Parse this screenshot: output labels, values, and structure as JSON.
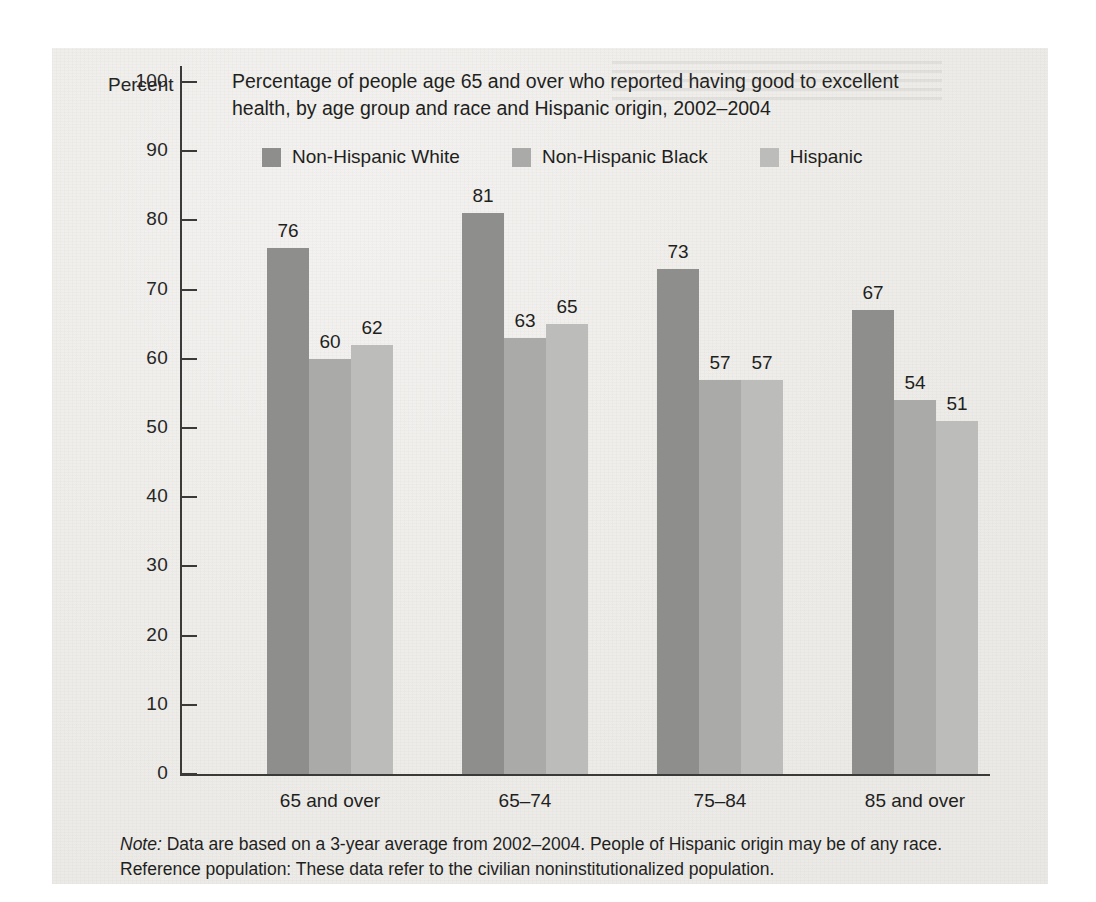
{
  "chart_data": {
    "type": "bar",
    "title": "Percentage of people age 65 and over who reported having good to excellent health, by age group and race and Hispanic origin, 2002–2004",
    "title_line1": "Percentage of people age 65 and over who reported having good to excellent",
    "title_line2": "health, by age group and race and Hispanic origin, 2002–2004",
    "xlabel": "",
    "ylabel": "Percent",
    "ylim": [
      0,
      100
    ],
    "ytick_labels": [
      "0",
      "10",
      "20",
      "30",
      "40",
      "50",
      "60",
      "70",
      "80",
      "90",
      "100"
    ],
    "ytick_values": [
      0,
      10,
      20,
      30,
      40,
      50,
      60,
      70,
      80,
      90,
      100
    ],
    "grid": false,
    "legend_position": "top",
    "categories": [
      "65 and over",
      "65–74",
      "75–84",
      "85 and over"
    ],
    "series": [
      {
        "name": "Non-Hispanic White",
        "color": "#8e8e8c",
        "values": [
          76,
          81,
          73,
          67
        ]
      },
      {
        "name": "Non-Hispanic Black",
        "color": "#aaaaa8",
        "values": [
          60,
          63,
          57,
          54
        ]
      },
      {
        "name": "Hispanic",
        "color": "#bcbcba",
        "values": [
          62,
          65,
          57,
          51
        ]
      }
    ]
  },
  "note": {
    "label": "Note:",
    "line1_rest": " Data are based on a 3-year average from 2002–2004. People of Hispanic origin may be of any race.",
    "line2": "Reference population: These data refer to the civilian noninstitutionalized population."
  }
}
